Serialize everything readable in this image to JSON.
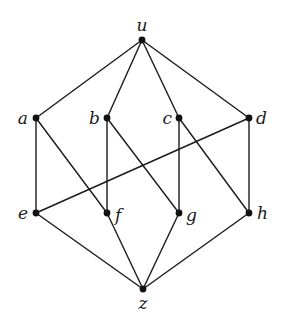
{
  "diagram": {
    "type": "hasse-diagram",
    "nodes": [
      {
        "id": "u",
        "label": "u",
        "level": "top"
      },
      {
        "id": "a",
        "label": "a",
        "level": "upper"
      },
      {
        "id": "b",
        "label": "b",
        "level": "upper"
      },
      {
        "id": "c",
        "label": "c",
        "level": "upper"
      },
      {
        "id": "d",
        "label": "d",
        "level": "upper"
      },
      {
        "id": "e",
        "label": "e",
        "level": "lower"
      },
      {
        "id": "f",
        "label": "f",
        "level": "lower"
      },
      {
        "id": "g",
        "label": "g",
        "level": "lower"
      },
      {
        "id": "h",
        "label": "h",
        "level": "lower"
      },
      {
        "id": "z",
        "label": "z",
        "level": "bottom"
      }
    ],
    "edges": [
      [
        "u",
        "a"
      ],
      [
        "u",
        "b"
      ],
      [
        "u",
        "c"
      ],
      [
        "u",
        "d"
      ],
      [
        "a",
        "e"
      ],
      [
        "a",
        "f"
      ],
      [
        "b",
        "f"
      ],
      [
        "b",
        "g"
      ],
      [
        "c",
        "g"
      ],
      [
        "c",
        "h"
      ],
      [
        "d",
        "h"
      ],
      [
        "d",
        "e"
      ],
      [
        "e",
        "z"
      ],
      [
        "f",
        "z"
      ],
      [
        "g",
        "z"
      ],
      [
        "h",
        "z"
      ]
    ]
  }
}
